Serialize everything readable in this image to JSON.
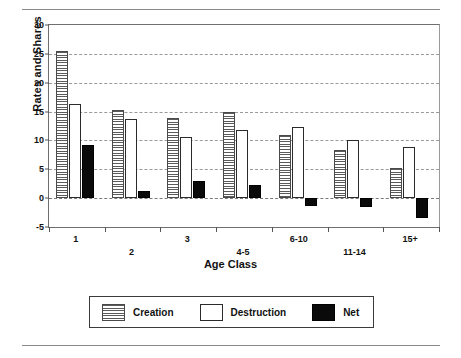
{
  "chart_data": {
    "type": "bar",
    "title": "",
    "xlabel": "Age Class",
    "ylabel": "Rates and Shares",
    "categories": [
      "1",
      "2",
      "3",
      "4-5",
      "6-10",
      "11-14",
      "15+"
    ],
    "series": [
      {
        "name": "Creation",
        "values": [
          25.5,
          15.2,
          13.8,
          14.9,
          10.9,
          8.4,
          5.3
        ]
      },
      {
        "name": "Destruction",
        "values": [
          16.3,
          13.7,
          10.6,
          11.8,
          12.3,
          10.0,
          8.9
        ]
      },
      {
        "name": "Net",
        "values": [
          9.2,
          1.2,
          2.9,
          2.2,
          -1.4,
          -1.6,
          -3.4
        ]
      }
    ],
    "ylim": [
      -5,
      30
    ],
    "yticks": [
      -5,
      0,
      5,
      10,
      15,
      20,
      25,
      30
    ],
    "ytick_labels": [
      "-5",
      "0",
      "5",
      "10",
      "15",
      "20",
      "25",
      "30"
    ],
    "grid": true,
    "legend_position": "bottom"
  },
  "legend": {
    "items": [
      {
        "label": "Creation",
        "swatch": "hatched-gray"
      },
      {
        "label": "Destruction",
        "swatch": "white-outline"
      },
      {
        "label": "Net",
        "swatch": "black"
      }
    ]
  },
  "colors": {
    "creation_hatch": "#5a5a5a",
    "destruction_fill": "#ffffff",
    "net_fill": "#0a0a0a",
    "grid": "#9a9a9a",
    "axis": "#6f6f6f"
  }
}
